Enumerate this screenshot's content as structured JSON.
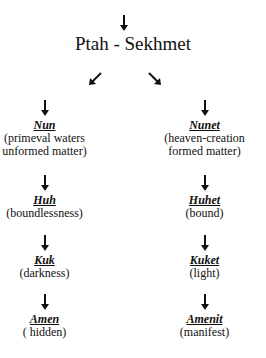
{
  "title": "Ptah - Sekhmet",
  "icons": {
    "top_arrow": "down-arrow-icon",
    "left_branch": "arrow-down-left-icon",
    "right_branch": "arrow-down-right-icon"
  },
  "left_column": [
    {
      "name": "Nun",
      "desc": "(primeval waters\nunformed matter)"
    },
    {
      "name": "Huh",
      "desc": "(boundlessness)"
    },
    {
      "name": "Kuk",
      "desc": "(darkness)"
    },
    {
      "name": "Amen",
      "desc": "( hidden)"
    }
  ],
  "right_column": [
    {
      "name": "Nunet",
      "desc": "(heaven-creation\nformed matter)"
    },
    {
      "name": "Huhet",
      "desc": "(bound)"
    },
    {
      "name": "Kuket",
      "desc": "(light)"
    },
    {
      "name": "Amenit",
      "desc": "(manifest)"
    }
  ],
  "colors": {
    "text": "#111111",
    "background": "#ffffff"
  }
}
